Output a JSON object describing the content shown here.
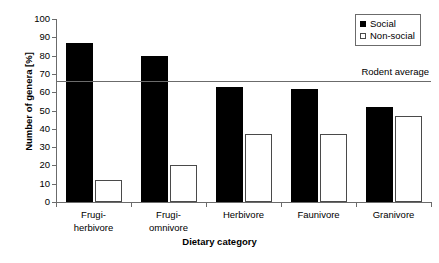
{
  "chart_data": {
    "type": "bar",
    "title": "",
    "xlabel": "Dietary category",
    "ylabel": "Number of genera [%]",
    "categories": [
      "Frugi-herbivore",
      "Frugi-omnivore",
      "Herbivore",
      "Faunivore",
      "Granivore"
    ],
    "category_lines": [
      [
        "Frugi-",
        "herbivore"
      ],
      [
        "Frugi-",
        "omnivore"
      ],
      [
        "Herbivore"
      ],
      [
        "Faunivore"
      ],
      [
        "Granivore"
      ]
    ],
    "series": [
      {
        "name": "Social",
        "color": "#000000",
        "style": "filled",
        "values": [
          87,
          80,
          63,
          62,
          52
        ]
      },
      {
        "name": "Non-social",
        "color": "#ffffff",
        "style": "open",
        "values": [
          12,
          20,
          37,
          37,
          47
        ]
      }
    ],
    "ylim": [
      0,
      100
    ],
    "yticks": [
      0,
      10,
      20,
      30,
      40,
      50,
      60,
      70,
      80,
      90,
      100
    ],
    "grid": false,
    "legend_position": "top-right",
    "annotations": [
      {
        "name": "rodent-average",
        "label": "Rodent average",
        "value": 66,
        "type": "horizontal-line"
      }
    ]
  },
  "legend": {
    "items": [
      {
        "label": "Social",
        "swatch": "filled-square-icon"
      },
      {
        "label": "Non-social",
        "swatch": "open-square-icon"
      }
    ]
  }
}
